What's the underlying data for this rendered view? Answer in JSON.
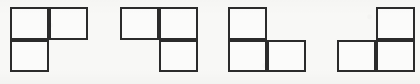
{
  "figure": {
    "kind": "line-drawing",
    "background_color": "#f8f8f6",
    "stroke_color": "#2b2b2b",
    "fill_color": "#fbfbfa",
    "stroke_width_px": 2,
    "canvas": {
      "width": 420,
      "height": 84
    },
    "cell": {
      "width": 39,
      "height": 32.5
    },
    "shapes": [
      {
        "name": "tromino-1",
        "label": "",
        "origin": {
          "x": 10,
          "y": 7
        },
        "cells": [
          {
            "col": 0,
            "row": 0
          },
          {
            "col": 1,
            "row": 0
          },
          {
            "col": 0,
            "row": 1
          }
        ]
      },
      {
        "name": "tromino-2",
        "label": "",
        "origin": {
          "x": 120,
          "y": 7
        },
        "cells": [
          {
            "col": 0,
            "row": 0
          },
          {
            "col": 1,
            "row": 0
          },
          {
            "col": 1,
            "row": 1
          }
        ]
      },
      {
        "name": "tromino-3",
        "label": "",
        "origin": {
          "x": 228,
          "y": 7
        },
        "cells": [
          {
            "col": 0,
            "row": 0
          },
          {
            "col": 0,
            "row": 1
          },
          {
            "col": 1,
            "row": 1
          }
        ]
      },
      {
        "name": "tromino-4",
        "label": "",
        "origin": {
          "x": 337,
          "y": 7
        },
        "cells": [
          {
            "col": 1,
            "row": 0
          },
          {
            "col": 0,
            "row": 1
          },
          {
            "col": 1,
            "row": 1
          }
        ]
      }
    ]
  }
}
